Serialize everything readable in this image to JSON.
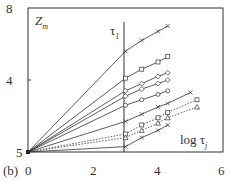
{
  "chart_data": {
    "type": "line",
    "panel_label": "(b)",
    "title": "",
    "xlabel": "log τ_j",
    "ylabel": "Z_m",
    "annotation": "τ_1",
    "x_ticks": [
      "0",
      "2",
      "4",
      "6"
    ],
    "y_ticks": [
      "8",
      "4",
      "5"
    ],
    "xlim": [
      0,
      6
    ],
    "ylim": [
      0,
      8
    ],
    "vertical_line_x": 3,
    "series": [
      {
        "name": "s1",
        "style": "solid",
        "marker": "x",
        "points": [
          [
            0,
            0
          ],
          [
            3,
            5.6
          ],
          [
            3.5,
            6.2
          ],
          [
            4,
            6.7
          ],
          [
            4.3,
            7.0
          ]
        ]
      },
      {
        "name": "s2",
        "style": "solid",
        "marker": "square",
        "points": [
          [
            0,
            0
          ],
          [
            3,
            4.1
          ],
          [
            3.5,
            4.6
          ],
          [
            4,
            5.0
          ],
          [
            4.3,
            5.3
          ]
        ]
      },
      {
        "name": "s3",
        "style": "solid",
        "marker": "diamond",
        "points": [
          [
            0,
            0
          ],
          [
            3,
            3.4
          ],
          [
            3.5,
            3.8
          ],
          [
            4,
            4.2
          ],
          [
            4.3,
            4.4
          ]
        ]
      },
      {
        "name": "s4",
        "style": "solid",
        "marker": "diamond",
        "points": [
          [
            0,
            0
          ],
          [
            3,
            3.1
          ],
          [
            3.5,
            3.5
          ],
          [
            4,
            3.8
          ],
          [
            4.3,
            4.0
          ]
        ]
      },
      {
        "name": "s5",
        "style": "solid",
        "marker": "circle",
        "points": [
          [
            0,
            0
          ],
          [
            3,
            2.6
          ],
          [
            3.5,
            2.9
          ],
          [
            4,
            3.2
          ],
          [
            4.3,
            3.4
          ]
        ]
      },
      {
        "name": "s6",
        "style": "solid",
        "marker": "x",
        "points": [
          [
            0,
            0
          ],
          [
            3,
            1.7
          ],
          [
            3.5,
            2.1
          ],
          [
            4,
            2.5
          ],
          [
            4.3,
            2.7
          ],
          [
            5.0,
            3.3
          ]
        ]
      },
      {
        "name": "s7",
        "style": "dotted",
        "marker": "square",
        "points": [
          [
            0,
            0
          ],
          [
            3,
            1.0
          ],
          [
            3.5,
            1.5
          ],
          [
            4,
            1.9
          ],
          [
            4.3,
            2.2
          ],
          [
            5.2,
            2.9
          ]
        ]
      },
      {
        "name": "s8",
        "style": "dotted",
        "marker": "triangle",
        "points": [
          [
            0,
            0
          ],
          [
            3,
            0.8
          ],
          [
            3.5,
            1.2
          ],
          [
            4,
            1.6
          ],
          [
            4.3,
            1.9
          ],
          [
            5.2,
            2.5
          ]
        ]
      },
      {
        "name": "s9",
        "style": "solid",
        "marker": "x",
        "points": [
          [
            0,
            0
          ],
          [
            3,
            0.3
          ],
          [
            3.5,
            0.8
          ],
          [
            4,
            1.2
          ],
          [
            4.3,
            1.5
          ]
        ]
      }
    ]
  },
  "labels": {
    "panel": "(b)",
    "ylabel": "Z",
    "ylabel_sub": "m",
    "xlabel": "log τ",
    "xlabel_sub": "j",
    "annotation": "τ",
    "annotation_sub": "1",
    "xtick0": "0",
    "xtick1": "2",
    "xtick2": "4",
    "xtick3": "6",
    "ytick_top": "8",
    "ytick_mid": "4",
    "ytick_bot": "5"
  }
}
